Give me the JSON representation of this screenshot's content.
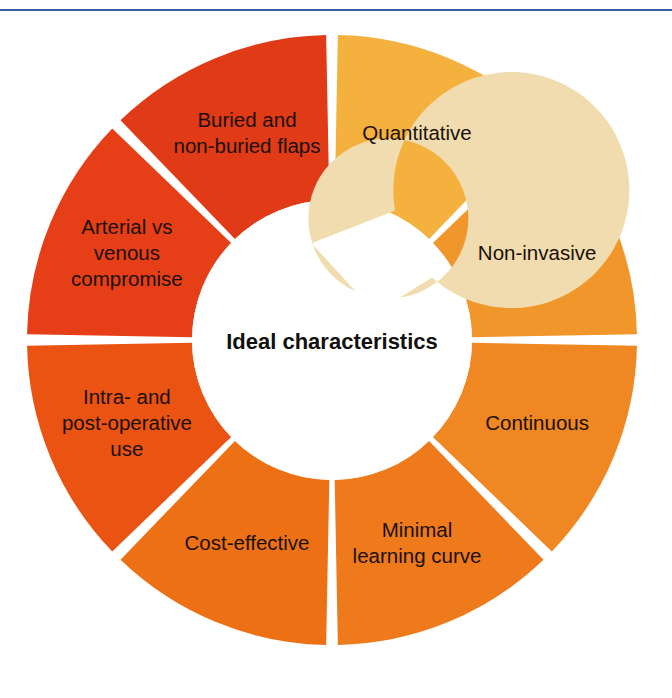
{
  "figure": {
    "name": "ideal-characteristics-wheel",
    "center_label": "Ideal characteristics",
    "background_color": "#ffffff",
    "top_rule_color": "#3b5ba5",
    "inner_arrow_color": "#f0dcae",
    "gap_color": "#ffffff",
    "label_color": "#1a1008"
  },
  "chart_data": {
    "type": "pie",
    "title": "Ideal characteristics",
    "xlabel": "",
    "ylabel": "",
    "legend_position": "none",
    "grid": false,
    "note": "Eight equal 45-degree segments arranged clockwise starting at the top; inner hub shows a circular clockwise arrow with the center label.",
    "categories": [
      "Quantitative",
      "Non-invasive",
      "Continuous",
      "Minimal learning curve",
      "Cost-effective",
      "Intra- and post-operative use",
      "Arterial vs venous compromise",
      "Buried and non-buried flaps"
    ],
    "values": [
      12.5,
      12.5,
      12.5,
      12.5,
      12.5,
      12.5,
      12.5,
      12.5
    ],
    "colors": [
      "#f4b13e",
      "#f0962a",
      "#ef8722",
      "#ef7a1b",
      "#ee7014",
      "#ea5312",
      "#e63f17",
      "#e03a16"
    ]
  },
  "segments": [
    {
      "id": "quantitative",
      "label": "Quantitative",
      "lines": [
        "Quantitative"
      ],
      "color": "#f4b13e",
      "start_angle": 0,
      "end_angle": 45
    },
    {
      "id": "non-invasive",
      "label": "Non-invasive",
      "lines": [
        "Non-invasive"
      ],
      "color": "#f0962a",
      "start_angle": 45,
      "end_angle": 90
    },
    {
      "id": "continuous",
      "label": "Continuous",
      "lines": [
        "Continuous"
      ],
      "color": "#ef8722",
      "start_angle": 90,
      "end_angle": 135
    },
    {
      "id": "minimal-learning-curve",
      "label": "Minimal learning curve",
      "lines": [
        "Minimal",
        "learning curve"
      ],
      "color": "#ef7a1b",
      "start_angle": 135,
      "end_angle": 180
    },
    {
      "id": "cost-effective",
      "label": "Cost-effective",
      "lines": [
        "Cost-effective"
      ],
      "color": "#ee7014",
      "start_angle": 180,
      "end_angle": 225
    },
    {
      "id": "intra-and-post-operative-use",
      "label": "Intra- and post-operative use",
      "lines": [
        "Intra- and",
        "post-operative",
        "use"
      ],
      "color": "#ea5312",
      "start_angle": 225,
      "end_angle": 270
    },
    {
      "id": "arterial-vs-venous-compromise",
      "label": "Arterial vs venous compromise",
      "lines": [
        "Arterial vs",
        "venous",
        "compromise"
      ],
      "color": "#e63f17",
      "start_angle": 270,
      "end_angle": 315
    },
    {
      "id": "buried-and-non-buried-flaps",
      "label": "Buried and non-buried flaps",
      "lines": [
        "Buried and",
        "non-buried flaps"
      ],
      "color": "#e03a16",
      "start_angle": 315,
      "end_angle": 360
    }
  ],
  "geometry": {
    "cx": 332,
    "cy": 340,
    "outer_radius": 305,
    "inner_radius": 140,
    "gap_degrees": 2.2,
    "label_radius": 222,
    "arrow_ring_outer": 118,
    "arrow_ring_inner": 80
  }
}
